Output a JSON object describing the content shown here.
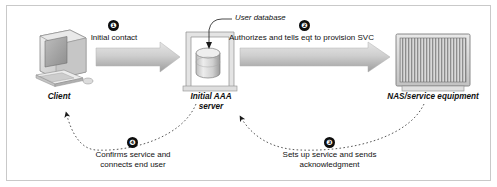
{
  "figure": {
    "background_color": "#ffffff",
    "border_color": "#c9c9c9",
    "arrow_fill_light": "#d8d8d8",
    "arrow_fill_dark": "#9a9a9a",
    "step_badge_color": "#0d0d0d",
    "text_color": "#111111"
  },
  "nodes": [
    {
      "id": "client",
      "label": "Client",
      "icon": "desktop-computer-icon"
    },
    {
      "id": "aaa-server",
      "label_line1": "Initial AAA",
      "label_line2": "server",
      "icon": "server-rack-with-database-icon",
      "callout": "User database",
      "callout_target_icon": "database-cylinder-icon"
    },
    {
      "id": "nas",
      "label": "NAS/service equipment",
      "icon": "nas-chassis-icon"
    }
  ],
  "steps": [
    {
      "number": "1",
      "badge": "❶",
      "text": "Initial contact",
      "from": "client",
      "to": "aaa-server",
      "arrow_style": "solid-block-arrow",
      "direction": "right"
    },
    {
      "number": "2",
      "badge": "❷",
      "text": "Authorizes and tells eqt to provision SVC",
      "from": "aaa-server",
      "to": "nas",
      "arrow_style": "solid-block-arrow",
      "direction": "right"
    },
    {
      "number": "3",
      "badge": "❸",
      "text_line1": "Sets up service and sends",
      "text_line2": "acknowledgment",
      "from": "nas",
      "to": "aaa-server",
      "arrow_style": "dotted-curve-arrow",
      "direction": "left"
    },
    {
      "number": "4",
      "badge": "❹",
      "text_line1": "Confirms service and",
      "text_line2": "connects end user",
      "from": "aaa-server",
      "to": "client",
      "arrow_style": "dotted-curve-arrow",
      "direction": "left"
    }
  ]
}
